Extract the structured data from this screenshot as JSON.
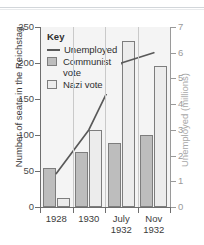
{
  "chart_data": {
    "type": "bar",
    "title": "",
    "subtitle": "",
    "categories": [
      "1928",
      "1930",
      "July\n1932",
      "Nov\n1932"
    ],
    "series": [
      {
        "name": "Communist vote",
        "axis": "left",
        "values": [
          54,
          77,
          89,
          100
        ],
        "color": "#bdbdbd"
      },
      {
        "name": "Nazi vote",
        "axis": "left",
        "values": [
          12,
          107,
          230,
          196
        ],
        "color": "#ececec"
      },
      {
        "name": "Unemployed",
        "axis": "right",
        "type": "line",
        "values": [
          1.3,
          3.0,
          5.6,
          6.0
        ],
        "color": "#595959"
      }
    ],
    "xlabel": "",
    "ylabel": "Number of seats in the Reichstag",
    "ylabel_right": "Unemployed (millions)",
    "ylim": [
      0,
      250
    ],
    "ylim_right": [
      0,
      7
    ],
    "yticks": [
      0,
      50,
      100,
      150,
      200,
      250
    ],
    "yticks_right": [
      0,
      1,
      2,
      3,
      4,
      5,
      6,
      7
    ],
    "ytick_labels": [
      "0",
      "50",
      "100",
      "150",
      "200",
      "250"
    ],
    "ytick_labels_right": [
      "0",
      "1",
      "2",
      "3",
      "4",
      "5",
      "6",
      "7"
    ],
    "grid": false,
    "legend_position": "top-left",
    "legend_title": "Key"
  },
  "legend": {
    "title": "Key",
    "entries": [
      {
        "label": "Unemployed",
        "marker": "line"
      },
      {
        "label": "Communist\nvote",
        "marker": "box-communist"
      },
      {
        "label": "Nazi vote",
        "marker": "box-nazi"
      }
    ]
  },
  "axes": {
    "left_title": "Number of seats in the Reichstag",
    "right_title": "Unemployed (millions)"
  }
}
